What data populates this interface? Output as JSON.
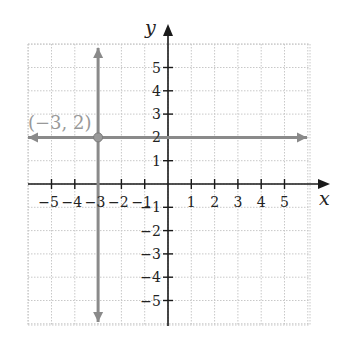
{
  "chart_data": {
    "type": "line",
    "title": "",
    "xlabel": "x",
    "ylabel": "y",
    "xlim": [
      -6,
      6
    ],
    "ylim": [
      -6,
      6
    ],
    "grid": true,
    "x_ticks": [
      -5,
      -4,
      -3,
      -2,
      -1,
      1,
      2,
      3,
      4,
      5
    ],
    "y_ticks": [
      -5,
      -4,
      -3,
      -2,
      -1,
      1,
      2,
      3,
      4,
      5
    ],
    "x_tick_labels": [
      "−5",
      "−4",
      "−3",
      "−2",
      "−1",
      "1",
      "2",
      "3",
      "4",
      "5"
    ],
    "y_tick_labels": [
      "−5",
      "−4",
      "−3",
      "−2",
      "−1",
      "1",
      "2",
      "3",
      "4",
      "5"
    ],
    "series": [
      {
        "name": "horizontal line y = 2",
        "equation": "y = 2",
        "x": [
          -6,
          6
        ],
        "y": [
          2,
          2
        ],
        "color": "#8a8a8a",
        "arrows": "both"
      },
      {
        "name": "vertical line x = -3",
        "equation": "x = -3",
        "x": [
          -3,
          -3
        ],
        "y": [
          6,
          -6
        ],
        "color": "#8a8a8a",
        "arrows": "both"
      }
    ],
    "points": [
      {
        "x": -3,
        "y": 2,
        "label": "(−3, 2)"
      }
    ]
  },
  "labels": {
    "x_axis": "x",
    "y_axis": "y",
    "point": "(−3, 2)"
  },
  "colors": {
    "axis": "#1a1a1a",
    "grid": "#c8c8c8",
    "line": "#8a8a8a",
    "point_label": "#999999"
  }
}
